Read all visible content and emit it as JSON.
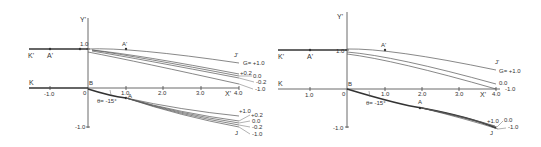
{
  "figure": {
    "background": "#ffffff",
    "ink_color": "#333333",
    "panels": [
      {
        "id": "left",
        "axis_labels": {
          "y": "Y'",
          "x": "X'"
        },
        "upper_labels": {
          "k_prime": "K'",
          "a_prime": "A'",
          "a_prime_right": "A'",
          "j_prime": "J'",
          "y_one": "1.0"
        },
        "lower_labels": {
          "k": "K",
          "b": "B",
          "origin": "0",
          "a": "A",
          "j": "J",
          "y_minus_one": "-1.0",
          "theta": "θ= -15°"
        },
        "x_ticks": [
          "-1.0",
          "1.0",
          "2.0",
          "3.0",
          "4.0"
        ],
        "upper_g_labels": [
          "G= +1.0",
          "+0.2",
          "0.0",
          "-0.2",
          "-1.0"
        ],
        "lower_g_labels": [
          "+1.0",
          "+0.2",
          "0.0",
          "-0.2",
          "-1.0"
        ]
      },
      {
        "id": "right",
        "axis_labels": {
          "y": "Y'",
          "x": "X'"
        },
        "upper_labels": {
          "k_prime": "K'",
          "a_prime": "A'",
          "a_prime_right": "A'",
          "j_prime": "J'",
          "y_one": "1.0"
        },
        "lower_labels": {
          "k": "K",
          "b": "B",
          "origin": "0",
          "a": "A",
          "j": "J",
          "y_minus_one": "-1.0",
          "theta": "θ= -15°"
        },
        "x_ticks": [
          "1.0",
          "1.0",
          "2.0",
          "3.0",
          "4.0"
        ],
        "upper_g_labels": [
          "G= +1.0",
          "0.0",
          "-1.0"
        ],
        "lower_g_labels": [
          "+1.0",
          "0.0",
          "-1.0"
        ]
      }
    ]
  }
}
